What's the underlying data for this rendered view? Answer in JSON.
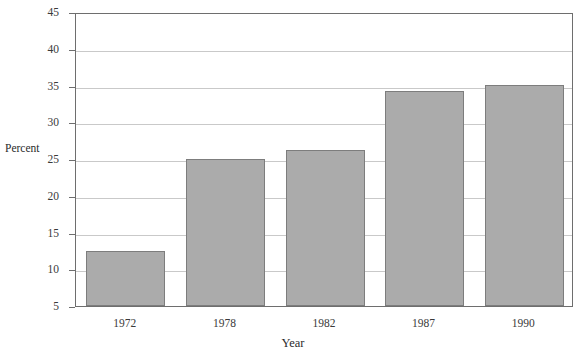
{
  "chart_data": {
    "type": "bar",
    "title": "",
    "xlabel": "Year",
    "ylabel": "Percent",
    "categories": [
      "1972",
      "1978",
      "1982",
      "1987",
      "1990"
    ],
    "values": [
      12.5,
      25.0,
      26.2,
      34.2,
      35.1
    ],
    "ylim": [
      5,
      45
    ],
    "yticks": [
      5,
      10,
      15,
      20,
      25,
      30,
      35,
      40,
      45
    ],
    "ytick_labels": [
      "5",
      "10",
      "15",
      "20",
      "25",
      "30",
      "35",
      "40",
      "45"
    ],
    "grid": true,
    "legend": "none",
    "bar_color": "#ababab",
    "bar_edge_color": "#7d7d7d",
    "grid_color": "#c9c9c9",
    "axis_color": "#6e6e6e"
  }
}
